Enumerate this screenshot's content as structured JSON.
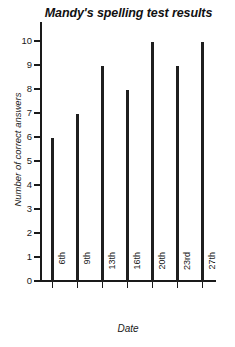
{
  "chart_data": {
    "type": "bar",
    "title": "Mandy's spelling test results",
    "xlabel": "Date",
    "ylabel": "Number of correct answers",
    "categories": [
      "6th",
      "9th",
      "13th",
      "16th",
      "20th",
      "23rd",
      "27th"
    ],
    "values": [
      6,
      7,
      9,
      8,
      10,
      9,
      10
    ],
    "ylim": [
      0,
      10
    ],
    "yticks": [
      0,
      1,
      2,
      3,
      4,
      5,
      6,
      7,
      8,
      9,
      10
    ],
    "ytick_labels": [
      "0",
      "1",
      "2",
      "3",
      "4",
      "5",
      "6",
      "7",
      "8",
      "9",
      "10"
    ],
    "grid": false,
    "legend": false,
    "bar_color": "#1f1f1f",
    "axis_color": "#1a1a1a",
    "background_color": "#ffffff"
  }
}
